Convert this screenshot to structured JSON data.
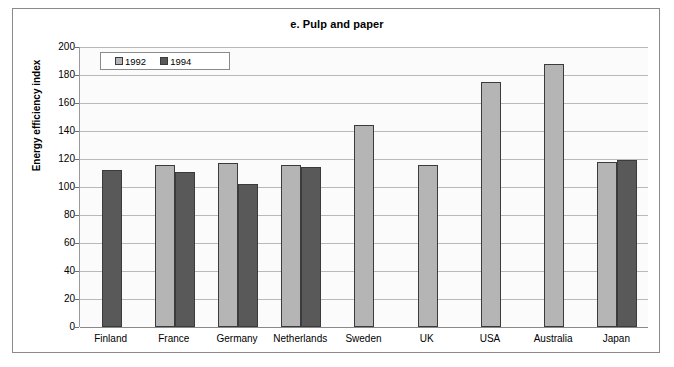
{
  "chart_data": {
    "type": "bar",
    "title": "e. Pulp and paper",
    "xlabel": "",
    "ylabel": "Energy efficiency index",
    "ylim": [
      0,
      200
    ],
    "ytick_step": 20,
    "yticks": [
      200,
      180,
      160,
      140,
      120,
      100,
      80,
      60,
      40,
      20,
      0
    ],
    "grid": true,
    "legend_position": "top-left",
    "categories": [
      "Finland",
      "France",
      "Germany",
      "Netherlands",
      "Sweden",
      "UK",
      "USA",
      "Australia",
      "Japan"
    ],
    "series": [
      {
        "name": "1992",
        "color": "#b5b5b5",
        "values": [
          null,
          116,
          117,
          116,
          144,
          116,
          175,
          188,
          118
        ]
      },
      {
        "name": "1994",
        "color": "#595959",
        "values": [
          112,
          111,
          102,
          114,
          null,
          null,
          null,
          null,
          119
        ]
      }
    ]
  },
  "legend": {
    "items": [
      {
        "label": "1992",
        "swatch": "y1992"
      },
      {
        "label": "1994",
        "swatch": "y1994"
      }
    ]
  },
  "colors": {
    "series_1992": "#b5b5b5",
    "series_1994": "#595959",
    "gridline": "#b9b9b9",
    "axis": "#8a8a8a",
    "frame": "#8a8a8a",
    "plot_background": "#fbfbfb"
  }
}
